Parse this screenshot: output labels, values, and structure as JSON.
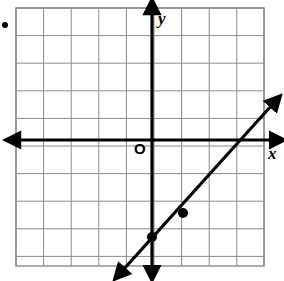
{
  "figure": {
    "width": 284,
    "height": 281,
    "background_color": "#ffffff",
    "bullet_marker": {
      "name": "bullet-dot",
      "x": 5,
      "y": 25,
      "radius": 3,
      "color": "#000000"
    }
  },
  "grid": {
    "left": 16,
    "top": 8,
    "right": 264,
    "bottom": 266,
    "cell_size": 27.6,
    "columns": 9,
    "rows": 9,
    "line_color": "#8a8a8a",
    "line_width": 1,
    "border_color": "#8a8a8a"
  },
  "axes": {
    "color": "#000000",
    "line_width": 3.2,
    "origin": {
      "x": 152,
      "y": 140
    },
    "x_axis": {
      "label": "x",
      "orientation": "horizontal",
      "y": 140,
      "start_x": 18,
      "end_x": 272,
      "arrow_left": true,
      "arrow_right": true
    },
    "y_axis": {
      "label": "y",
      "orientation": "vertical",
      "x": 152,
      "start_y": 12,
      "end_y": 268,
      "arrow_top": true,
      "arrow_bottom": true
    },
    "origin_label": "O"
  },
  "chart_data": {
    "type": "line",
    "xlabel": "x",
    "ylabel": "y",
    "grid": true,
    "legend": "none",
    "xlim": [
      -5,
      4
    ],
    "ylim": [
      -5,
      4
    ],
    "unit_px": 27.6,
    "origin_px": {
      "x": 152,
      "y": 140
    },
    "series": [
      {
        "name": "line",
        "kind": "line",
        "slope": 1,
        "y_intercept": -3.5,
        "equation": "y = x - 3.5",
        "extends_both_directions": true,
        "arrow_start": true,
        "arrow_end": true,
        "pixel_start": {
          "x": 123,
          "y": 270
        },
        "pixel_end": {
          "x": 272,
          "y": 105
        },
        "color": "#000000",
        "line_width": 3.2,
        "points": [
          {
            "label": "",
            "x": 0,
            "y": -3.5,
            "px": 152,
            "py": 237,
            "marker": "filled-circle"
          },
          {
            "label": "",
            "x": 1.1,
            "y": -2.4,
            "px": 183,
            "py": 213,
            "marker": "filled-circle"
          }
        ]
      }
    ]
  }
}
